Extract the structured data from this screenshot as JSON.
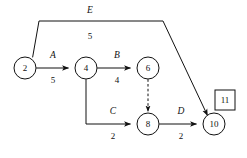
{
  "diagram": {
    "type": "activity-on-arrow-network",
    "background_color": "#ffffff",
    "line_color": "#111111",
    "nodes": [
      {
        "id": "2",
        "label": "2",
        "cx": 25,
        "cy": 68,
        "r": 11
      },
      {
        "id": "4",
        "label": "4",
        "cx": 86,
        "cy": 68,
        "r": 11
      },
      {
        "id": "6",
        "label": "6",
        "cx": 148,
        "cy": 68,
        "r": 11
      },
      {
        "id": "8",
        "label": "8",
        "cx": 148,
        "cy": 124,
        "r": 11
      },
      {
        "id": "10",
        "label": "10",
        "cx": 214,
        "cy": 124,
        "r": 11
      }
    ],
    "terminal": {
      "label": "11",
      "x": 215,
      "y": 90,
      "width": 20,
      "height": 20
    },
    "edges": [
      {
        "id": "edge-A",
        "name": "A",
        "duration": "5",
        "from": "2",
        "to": "4",
        "style": "solid",
        "arrow": true,
        "name_x": 53,
        "name_y": 56,
        "duration_x": 53,
        "duration_y": 81
      },
      {
        "id": "edge-B",
        "name": "B",
        "duration": "4",
        "from": "4",
        "to": "6",
        "style": "solid",
        "arrow": true,
        "name_x": 117,
        "name_y": 56,
        "duration_x": 117,
        "duration_y": 81
      },
      {
        "id": "edge-C",
        "name": "C",
        "duration": "2",
        "from": "4",
        "to": "8",
        "style": "solid",
        "arrow": true,
        "name_x": 113,
        "name_y": 112,
        "duration_x": 113,
        "duration_y": 137
      },
      {
        "id": "edge-D",
        "name": "D",
        "duration": "2",
        "from": "8",
        "to": "10",
        "style": "solid",
        "arrow": true,
        "name_x": 181,
        "name_y": 112,
        "duration_x": 181,
        "duration_y": 137
      },
      {
        "id": "edge-E",
        "name": "E",
        "duration": "5",
        "from": "2",
        "to": "10",
        "style": "solid",
        "arrow": true,
        "name_x": 90,
        "name_y": 11,
        "duration_x": 90,
        "duration_y": 37
      },
      {
        "id": "edge-dummy",
        "name": "",
        "duration": "",
        "from": "6",
        "to": "8",
        "style": "dashed",
        "arrow": true,
        "name_x": 0,
        "name_y": 0,
        "duration_x": 0,
        "duration_y": 0
      }
    ],
    "paths": {
      "edge_A": "M 36.2 68 L 68.5 68",
      "edge_B": "M 97.2 68 L 130.5 68",
      "edge_C": "M 86 79.2 L 86 124 L 130.5 124",
      "edge_D": "M 159.2 124 L 196.5 124",
      "edge_E": "M 32.6 57.4 L 39 21 L 163 21 L 207.5 115.5",
      "edge_dummy": "M 148 79.2 L 148 111.5"
    }
  }
}
